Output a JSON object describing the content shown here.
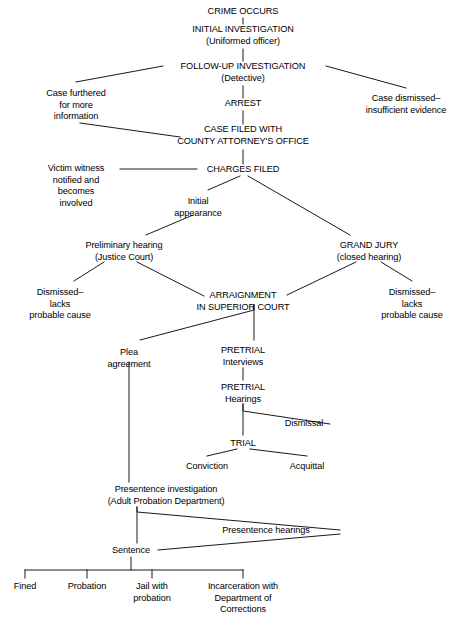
{
  "figure": {
    "line_color": "#1a1a1a",
    "text_color": "#000000",
    "background": "#ffffff"
  },
  "nodes": [
    {
      "id": "crime-occurs",
      "lines": [
        "CRIME OCCURS"
      ],
      "style": "caps",
      "x": 243,
      "y": 6
    },
    {
      "id": "initial-investigation",
      "lines": [
        "INITIAL INVESTIGATION",
        "(Uniformed officer)"
      ],
      "style": "caps",
      "x": 243,
      "y": 24
    },
    {
      "id": "follow-up-investigation",
      "lines": [
        "FOLLOW-UP INVESTIGATION",
        "(Detective)"
      ],
      "style": "caps",
      "x": 243,
      "y": 61
    },
    {
      "id": "case-furthered",
      "lines": [
        "Case furthered",
        "for more",
        "information"
      ],
      "style": "mixed",
      "x": 76,
      "y": 88
    },
    {
      "id": "case-dismissed-evidence",
      "lines": [
        "Case dismissed–",
        "insufficient evidence"
      ],
      "style": "mixed",
      "x": 406,
      "y": 93
    },
    {
      "id": "arrest",
      "lines": [
        "ARREST"
      ],
      "style": "caps",
      "x": 243,
      "y": 98
    },
    {
      "id": "case-filed",
      "lines": [
        "CASE FILED WITH",
        "COUNTY ATTORNEY'S OFFICE"
      ],
      "style": "caps",
      "x": 243,
      "y": 124
    },
    {
      "id": "victim-witness",
      "lines": [
        "Victim witness",
        "notified and",
        "becomes",
        "involved"
      ],
      "style": "mixed",
      "x": 76,
      "y": 163
    },
    {
      "id": "charges-filed",
      "lines": [
        "CHARGES FILED"
      ],
      "style": "caps",
      "x": 243,
      "y": 164
    },
    {
      "id": "initial-appearance",
      "lines": [
        "Initial",
        "appearance"
      ],
      "style": "mixed",
      "x": 198,
      "y": 196
    },
    {
      "id": "preliminary-hearing",
      "lines": [
        "Preliminary hearing",
        "(Justice Court)"
      ],
      "style": "mixed",
      "x": 124,
      "y": 240
    },
    {
      "id": "grand-jury",
      "lines": [
        "GRAND JURY",
        "(closed hearing)"
      ],
      "style": "caps",
      "x": 369,
      "y": 240
    },
    {
      "id": "dismissed-left",
      "lines": [
        "Dismissed–",
        "lacks",
        "probable cause"
      ],
      "style": "mixed",
      "x": 60,
      "y": 287
    },
    {
      "id": "arraignment",
      "lines": [
        "ARRAIGNMENT",
        "IN SUPERIOR COURT"
      ],
      "style": "caps",
      "x": 243,
      "y": 290
    },
    {
      "id": "dismissed-right",
      "lines": [
        "Dismissed–",
        "lacks",
        "probable cause"
      ],
      "style": "mixed",
      "x": 412,
      "y": 287
    },
    {
      "id": "plea-agreement",
      "lines": [
        "Plea",
        "agreement"
      ],
      "style": "mixed",
      "x": 129,
      "y": 347
    },
    {
      "id": "pretrial-interviews",
      "lines": [
        "PRETRIAL",
        "Interviews"
      ],
      "style": "caps",
      "x": 243,
      "y": 345
    },
    {
      "id": "pretrial-hearings",
      "lines": [
        "PRETRIAL",
        "Hearings"
      ],
      "style": "caps",
      "x": 243,
      "y": 382
    },
    {
      "id": "dismissal",
      "lines": [
        "Dismissal"
      ],
      "style": "mixed",
      "x": 304,
      "y": 418
    },
    {
      "id": "trial",
      "lines": [
        "TRIAL"
      ],
      "style": "caps",
      "x": 243,
      "y": 438
    },
    {
      "id": "conviction",
      "lines": [
        "Conviction"
      ],
      "style": "mixed",
      "x": 207,
      "y": 461
    },
    {
      "id": "acquittal",
      "lines": [
        "Acquittal"
      ],
      "style": "mixed",
      "x": 307,
      "y": 461
    },
    {
      "id": "presentence-investigation",
      "lines": [
        "Presentence investigation",
        "(Adult Probation Department)"
      ],
      "style": "mixed",
      "x": 166,
      "y": 484
    },
    {
      "id": "presentence-hearings",
      "lines": [
        "Presentence hearings"
      ],
      "style": "mixed",
      "x": 266,
      "y": 525
    },
    {
      "id": "sentence",
      "lines": [
        "Sentence"
      ],
      "style": "mixed",
      "x": 131,
      "y": 545
    },
    {
      "id": "fined",
      "lines": [
        "Fined"
      ],
      "style": "mixed",
      "x": 25,
      "y": 581
    },
    {
      "id": "probation",
      "lines": [
        "Probation"
      ],
      "style": "mixed",
      "x": 87,
      "y": 581
    },
    {
      "id": "jail-with-probation",
      "lines": [
        "Jail with",
        "probation"
      ],
      "style": "mixed",
      "x": 152,
      "y": 581
    },
    {
      "id": "incarceration-doc",
      "lines": [
        "Incarceration with",
        "Department of",
        "Corrections"
      ],
      "style": "mixed",
      "x": 243,
      "y": 581
    }
  ],
  "edges": [
    {
      "id": "crime-to-initial",
      "points": [
        [
          243,
          18
        ],
        [
          243,
          24
        ]
      ]
    },
    {
      "id": "initial-to-followup",
      "points": [
        [
          243,
          49
        ],
        [
          243,
          61
        ]
      ]
    },
    {
      "id": "followup-to-case-furthered",
      "points": [
        [
          163,
          66
        ],
        [
          76,
          82
        ]
      ]
    },
    {
      "id": "followup-to-case-dismissed",
      "points": [
        [
          326,
          66
        ],
        [
          406,
          88
        ]
      ]
    },
    {
      "id": "followup-to-arrest",
      "points": [
        [
          243,
          86
        ],
        [
          243,
          98
        ]
      ]
    },
    {
      "id": "arrest-to-case-filed",
      "points": [
        [
          243,
          111
        ],
        [
          243,
          124
        ]
      ]
    },
    {
      "id": "case-furthered-to-case-filed",
      "points": [
        [
          80,
          123
        ],
        [
          180,
          137
        ]
      ]
    },
    {
      "id": "case-filed-to-charges-filed",
      "points": [
        [
          243,
          150
        ],
        [
          243,
          164
        ]
      ]
    },
    {
      "id": "victim-witness-to-charges",
      "points": [
        [
          120,
          169
        ],
        [
          197,
          169
        ]
      ]
    },
    {
      "id": "charges-to-initial-appearance",
      "points": [
        [
          240,
          176
        ],
        [
          208,
          190
        ]
      ]
    },
    {
      "id": "charges-to-grand-jury",
      "points": [
        [
          248,
          176
        ],
        [
          350,
          235
        ]
      ]
    },
    {
      "id": "initial-appearance-to-prelim",
      "points": [
        [
          193,
          215
        ],
        [
          146,
          235
        ]
      ]
    },
    {
      "id": "prelim-to-dismissed-left",
      "points": [
        [
          104,
          262
        ],
        [
          74,
          281
        ]
      ]
    },
    {
      "id": "prelim-to-arraignment",
      "points": [
        [
          137,
          262
        ],
        [
          204,
          296
        ]
      ]
    },
    {
      "id": "grand-jury-to-arraignment",
      "points": [
        [
          356,
          262
        ],
        [
          287,
          295
        ]
      ]
    },
    {
      "id": "grand-jury-to-dismissed-right",
      "points": [
        [
          381,
          262
        ],
        [
          412,
          281
        ]
      ]
    },
    {
      "id": "arraignment-to-plea",
      "points": [
        [
          254,
          305
        ],
        [
          254,
          310
        ],
        [
          140,
          340
        ]
      ]
    },
    {
      "id": "arraignment-to-pretrial-intv",
      "points": [
        [
          254,
          305
        ],
        [
          254,
          340
        ]
      ]
    },
    {
      "id": "pretrial-intv-to-hearings",
      "points": [
        [
          243,
          368
        ],
        [
          243,
          380
        ]
      ]
    },
    {
      "id": "hearings-to-dismissal",
      "points": [
        [
          243,
          404
        ],
        [
          243,
          411
        ],
        [
          330,
          424
        ]
      ]
    },
    {
      "id": "hearings-to-trial",
      "points": [
        [
          243,
          404
        ],
        [
          243,
          435
        ]
      ]
    },
    {
      "id": "trial-to-conviction",
      "points": [
        [
          237,
          449
        ],
        [
          207,
          456
        ]
      ]
    },
    {
      "id": "trial-to-acquittal",
      "points": [
        [
          250,
          449
        ],
        [
          307,
          456
        ]
      ]
    },
    {
      "id": "plea-to-presentence-inv",
      "points": [
        [
          129,
          362
        ],
        [
          129,
          482
        ]
      ]
    },
    {
      "id": "presentence-inv-to-hearings",
      "points": [
        [
          137,
          507
        ],
        [
          137,
          512
        ],
        [
          340,
          530
        ]
      ]
    },
    {
      "id": "presentence-inv-to-sentence",
      "points": [
        [
          137,
          507
        ],
        [
          137,
          543
        ]
      ]
    },
    {
      "id": "sentence-to-presentence-hearings",
      "points": [
        [
          158,
          550
        ],
        [
          340,
          534
        ]
      ]
    },
    {
      "id": "sentence-stem",
      "points": [
        [
          131,
          557
        ],
        [
          131,
          570
        ]
      ]
    },
    {
      "id": "sentence-bus",
      "points": [
        [
          25,
          570
        ],
        [
          243,
          570
        ]
      ]
    },
    {
      "id": "drop-fined",
      "points": [
        [
          25,
          570
        ],
        [
          25,
          578
        ]
      ]
    },
    {
      "id": "drop-probation",
      "points": [
        [
          87,
          570
        ],
        [
          87,
          578
        ]
      ]
    },
    {
      "id": "drop-jail",
      "points": [
        [
          152,
          570
        ],
        [
          152,
          578
        ]
      ]
    },
    {
      "id": "drop-incarceration",
      "points": [
        [
          243,
          570
        ],
        [
          243,
          578
        ]
      ]
    }
  ]
}
